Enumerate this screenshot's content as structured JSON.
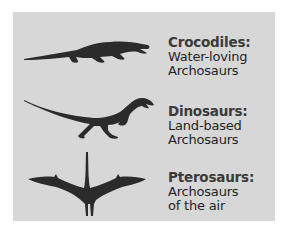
{
  "figure": {
    "background_color": "#d7d7d7",
    "silhouette_color": "#2b2b2b",
    "groups": [
      {
        "id": "crocodiles",
        "title": "Crocodiles:",
        "line1": "Water-loving",
        "line2": "Archosaurs",
        "icon": "crocodile-silhouette-icon"
      },
      {
        "id": "dinosaurs",
        "title": "Dinosaurs:",
        "line1": "Land-based",
        "line2": "Archosaurs",
        "icon": "dinosaur-silhouette-icon"
      },
      {
        "id": "pterosaurs",
        "title": "Pterosaurs:",
        "line1": "Archosaurs",
        "line2": "of the air",
        "icon": "pterosaur-silhouette-icon"
      }
    ]
  }
}
